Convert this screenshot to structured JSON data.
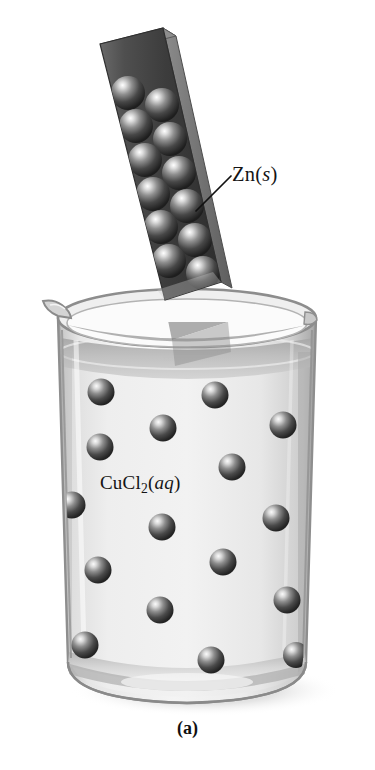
{
  "figure": {
    "caption": "(a)",
    "background_color": "#ffffff",
    "labels": {
      "zinc": {
        "full_text": "Zn(s)",
        "prefix": "Zn(",
        "italic_part": "s",
        "suffix": ")"
      },
      "solution": {
        "full_text": "CuCl2(aq)",
        "element_cu": "Cu",
        "element_cl": "Cl",
        "subscript": "2",
        "open_paren": "(",
        "italic_part": "aq",
        "close_paren": ")"
      }
    },
    "colors": {
      "sphere_dark": "#2b2b2b",
      "sphere_mid": "#6e6e6e",
      "sphere_highlight": "#f2f2f2",
      "strip_face": "#4a4a4a",
      "strip_side": "#6b6b6b",
      "strip_top": "#8a8a8a",
      "beaker_glass": "#d9d9d9",
      "beaker_rim": "#9a9a9a",
      "liquid_body": "#e3e3e3",
      "liquid_surface": "#b0b0b0",
      "shadow": "#c9c9c9",
      "leader_line": "#111111",
      "text": "#141414"
    },
    "elements": {
      "zinc_strip_name": "zinc metal strip",
      "beaker_name": "glass beaker",
      "liquid_name": "copper(II) chloride solution",
      "sphere_strip_count": 12,
      "sphere_solution_count": 16
    }
  }
}
